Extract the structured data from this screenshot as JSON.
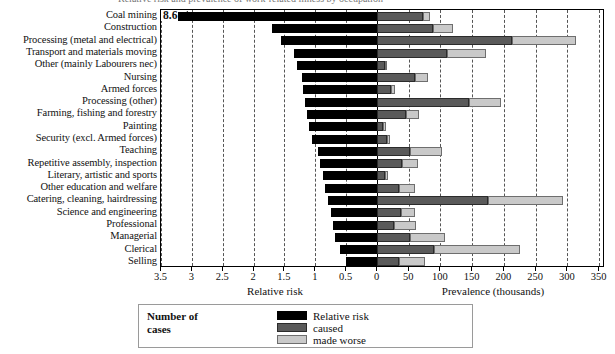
{
  "chart_data": {
    "type": "bar",
    "title": "Relative risk and prevalence of work-related illness by occupation",
    "orientation": "horizontal",
    "style": "back-to-back (bidirectional) bar chart",
    "grid": true,
    "left_panel": {
      "xlabel": "Relative risk",
      "series_name": "Relative risk",
      "axis_direction": "right-to-left (values decrease toward the centre)",
      "xlim": [
        3.5,
        0
      ],
      "baseline": 0,
      "ticks": [
        3.5,
        3,
        2.5,
        2,
        1.5,
        1,
        0.5,
        0
      ],
      "ticklabels": [
        "3.5",
        "3",
        "2.5",
        "2",
        "1.5",
        "1",
        "0.5",
        "0"
      ]
    },
    "right_panel": {
      "xlabel": "Prevalence (thousands)",
      "series_names": [
        "caused",
        "made worse"
      ],
      "stacked": true,
      "xlim": [
        0,
        350
      ],
      "ticks": [
        0,
        50,
        100,
        150,
        200,
        250,
        300,
        350
      ],
      "ticklabels": [
        "0",
        "50",
        "100",
        "150",
        "200",
        "250",
        "300",
        "350"
      ]
    },
    "categories": [
      "Coal mining",
      "Construction",
      "Processing (metal and electrical)",
      "Transport and materials moving",
      "Other (mainly Labourers nec)",
      "Nursing",
      "Armed forces",
      "Processing (other)",
      "Farming, fishing and forestry",
      "Painting",
      "Security (excl. Armed forces)",
      "Teaching",
      "Repetitive assembly, inspection",
      "Literary, artistic and sports",
      "Other education and welfare",
      "Catering, cleaning, hairdressing",
      "Science and engineering",
      "Professional",
      "Managerial",
      "Clerical",
      "Selling"
    ],
    "series": [
      {
        "name": "Relative risk",
        "panel": "left",
        "color": "#000000",
        "values": [
          8.6,
          1.7,
          1.55,
          1.35,
          1.3,
          1.22,
          1.2,
          1.17,
          1.13,
          1.1,
          1.05,
          0.95,
          0.92,
          0.88,
          0.85,
          0.8,
          0.75,
          0.72,
          0.68,
          0.6,
          0.5
        ]
      },
      {
        "name": "caused",
        "panel": "right",
        "color": "#5a5a5a",
        "values": [
          72,
          88,
          213,
          110,
          12,
          60,
          22,
          145,
          45,
          10,
          15,
          52,
          40,
          12,
          35,
          175,
          38,
          27,
          52,
          90,
          35
        ]
      },
      {
        "name": "made worse",
        "panel": "right",
        "color": "#c9c9c9",
        "values": [
          11,
          32,
          100,
          62,
          3,
          20,
          6,
          50,
          22,
          5,
          5,
          50,
          25,
          5,
          25,
          118,
          22,
          35,
          55,
          135,
          40
        ]
      }
    ],
    "annotations": [
      {
        "text": "8.6",
        "category": "Coal mining",
        "note": "Relative risk bar extends beyond the axis; an arrow marks the off-scale value"
      }
    ]
  },
  "legend": {
    "title": "Number of\ncases",
    "title_line1": "Number of",
    "title_line2": "cases",
    "items": [
      {
        "label": "Relative risk",
        "swatch": "rr"
      },
      {
        "label": "caused",
        "swatch": "caused"
      },
      {
        "label": "made worse",
        "swatch": "worse"
      }
    ]
  },
  "colors": {
    "relative_risk": "#000000",
    "caused": "#5a5a5a",
    "made_worse": "#c9c9c9",
    "gridline": "#555555",
    "axis": "#000000",
    "background": "#ffffff"
  }
}
